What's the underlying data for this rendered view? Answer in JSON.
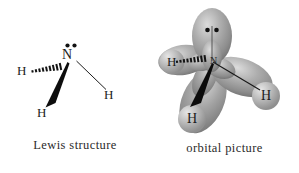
{
  "figure": {
    "background_color": "#ffffff"
  },
  "lewis": {
    "caption": "Lewis structure",
    "center_atom": {
      "symbol": "N",
      "lone_pair_dots": 2
    },
    "hydrogens": [
      {
        "symbol": "H",
        "position": "left",
        "bond_type": "hashed-wedge"
      },
      {
        "symbol": "H",
        "position": "bottom-left",
        "bond_type": "solid-wedge"
      },
      {
        "symbol": "H",
        "position": "right",
        "bond_type": "plain-line"
      }
    ],
    "bond_colors": {
      "line": "#1a1a1a",
      "wedge": "#111111",
      "hash": "#111111"
    }
  },
  "orbital": {
    "caption": "orbital picture",
    "center_atom": {
      "symbol": "N",
      "lone_pair_dots": 2,
      "hybridization_lobes": 4
    },
    "lobes": [
      {
        "name": "lone-pair-lobe",
        "direction": "up",
        "contains_dots": true
      },
      {
        "name": "bonding-lobe-left",
        "direction": "left"
      },
      {
        "name": "bonding-lobe-right",
        "direction": "right-down"
      },
      {
        "name": "bonding-lobe-down",
        "direction": "down-left"
      }
    ],
    "hydrogens": [
      {
        "symbol": "H",
        "position": "left",
        "bond_type": "hashed-wedge"
      },
      {
        "symbol": "H",
        "position": "bottom",
        "bond_type": "solid-wedge"
      },
      {
        "symbol": "H",
        "position": "right",
        "bond_type": "plain-line"
      }
    ],
    "colors": {
      "lobe_fill": "#9a9a9a",
      "lobe_highlight": "#d2d2d2",
      "lobe_shadow": "#6e6e6e",
      "sphere_fill": "#b5b5b5",
      "sphere_highlight": "#e0e0e0",
      "dot": "#101010"
    }
  }
}
